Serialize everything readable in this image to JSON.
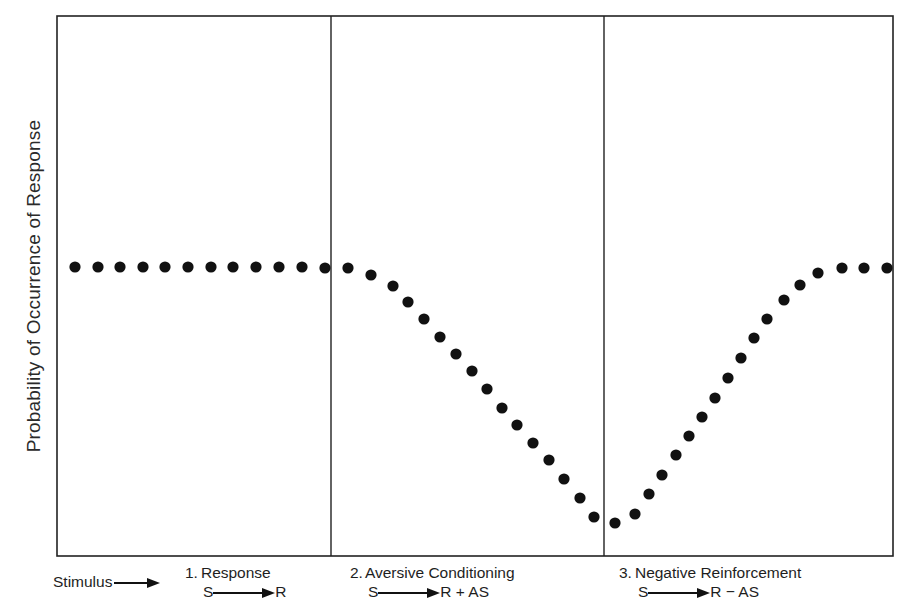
{
  "figure": {
    "y_axis_label": "Probability of Occurrence of Response",
    "stimulus_label": "Stimulus",
    "panels": [
      {
        "number": "1.",
        "title": "Response",
        "formula_left": "S",
        "formula_right": "R"
      },
      {
        "number": "2.",
        "title": "Aversive Conditioning",
        "formula_left": "S",
        "formula_right": "R + AS"
      },
      {
        "number": "3.",
        "title": "Negative Reinforcement",
        "formula_left": "S",
        "formula_right": "R − AS"
      }
    ],
    "colors": {
      "ink": "#111111",
      "frame": "#222222",
      "background": "#ffffff"
    }
  },
  "chart_data": {
    "type": "scatter",
    "title": "",
    "xlabel": "",
    "ylabel": "Probability of Occurrence of Response",
    "grid": false,
    "legend": "none",
    "frame_px": {
      "left": 57,
      "right": 893,
      "top": 16,
      "bottom": 556
    },
    "panel_dividers_px": [
      331,
      604
    ],
    "panels": [
      "1. Response  S→R",
      "2. Aversive Conditioning  S→R + AS",
      "3. Negative Reinforcement  S→R − AS"
    ],
    "points_px": [
      [
        75,
        267
      ],
      [
        98,
        267
      ],
      [
        120,
        267
      ],
      [
        143,
        267
      ],
      [
        165,
        267
      ],
      [
        188,
        267
      ],
      [
        211,
        267
      ],
      [
        233,
        267
      ],
      [
        256,
        267
      ],
      [
        279,
        267
      ],
      [
        302,
        267
      ],
      [
        325,
        268
      ],
      [
        348,
        268
      ],
      [
        371,
        275
      ],
      [
        393,
        286
      ],
      [
        408,
        302
      ],
      [
        424,
        319
      ],
      [
        440,
        337
      ],
      [
        456,
        354
      ],
      [
        472,
        371
      ],
      [
        487,
        389
      ],
      [
        502,
        408
      ],
      [
        517,
        425
      ],
      [
        533,
        443
      ],
      [
        549,
        460
      ],
      [
        564,
        479
      ],
      [
        580,
        498
      ],
      [
        594,
        517
      ],
      [
        615,
        523
      ],
      [
        635,
        514
      ],
      [
        649,
        494
      ],
      [
        662,
        475
      ],
      [
        676,
        455
      ],
      [
        689,
        436
      ],
      [
        702,
        417
      ],
      [
        715,
        398
      ],
      [
        728,
        378
      ],
      [
        741,
        358
      ],
      [
        754,
        338
      ],
      [
        767,
        319
      ],
      [
        784,
        300
      ],
      [
        800,
        285
      ],
      [
        818,
        273
      ],
      [
        842,
        268
      ],
      [
        864,
        268
      ],
      [
        887,
        268
      ]
    ],
    "series": [
      {
        "name": "Response (baseline)",
        "x": [
          1,
          2,
          3,
          4,
          5,
          6,
          7,
          8,
          9,
          10,
          11,
          12
        ],
        "values": [
          0.53,
          0.53,
          0.53,
          0.53,
          0.53,
          0.53,
          0.53,
          0.53,
          0.53,
          0.53,
          0.53,
          0.53
        ]
      },
      {
        "name": "Aversive Conditioning",
        "x": [
          13,
          14,
          15,
          16,
          17,
          18,
          19,
          20,
          21,
          22,
          23,
          24,
          25,
          26,
          27,
          28
        ],
        "values": [
          0.53,
          0.52,
          0.5,
          0.47,
          0.44,
          0.4,
          0.37,
          0.34,
          0.31,
          0.27,
          0.24,
          0.21,
          0.18,
          0.14,
          0.11,
          0.07
        ]
      },
      {
        "name": "Negative Reinforcement",
        "x": [
          29,
          30,
          31,
          32,
          33,
          34,
          35,
          36,
          37,
          38,
          39,
          40,
          41,
          42,
          43,
          44,
          45,
          46
        ],
        "values": [
          0.06,
          0.08,
          0.11,
          0.15,
          0.19,
          0.22,
          0.26,
          0.29,
          0.33,
          0.37,
          0.4,
          0.44,
          0.47,
          0.5,
          0.52,
          0.53,
          0.53,
          0.53
        ]
      }
    ],
    "ylim": [
      0,
      1
    ]
  }
}
